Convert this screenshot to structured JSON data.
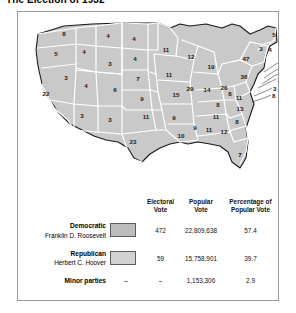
{
  "title": "The Election of 1932",
  "map": {
    "name": "united-states-electoral-map-1932",
    "fill_color": "#c9c9c9",
    "border_color": "#ffffff",
    "outline_color": "#1a1a1a",
    "states": [
      {
        "code": "WA",
        "ev": "8",
        "x": 46,
        "y": 22
      },
      {
        "code": "OR",
        "ev": "5",
        "x": 38,
        "y": 42
      },
      {
        "code": "CA",
        "ev": "22",
        "x": 26,
        "y": 82
      },
      {
        "code": "NV",
        "ev": "3",
        "x": 48,
        "y": 66
      },
      {
        "code": "ID",
        "ev": "4",
        "x": 64,
        "y": 40
      },
      {
        "code": "MT",
        "ev": "4",
        "x": 88,
        "y": 24
      },
      {
        "code": "WY",
        "ev": "3",
        "x": 90,
        "y": 52
      },
      {
        "code": "UT",
        "ev": "4",
        "x": 68,
        "y": 74
      },
      {
        "code": "AZ",
        "ev": "3",
        "x": 62,
        "y": 104
      },
      {
        "code": "CO",
        "ev": "6",
        "x": 97,
        "y": 78
      },
      {
        "code": "NM",
        "ev": "3",
        "x": 90,
        "y": 108
      },
      {
        "code": "ND",
        "ev": "4",
        "x": 114,
        "y": 27
      },
      {
        "code": "SD",
        "ev": "4",
        "x": 116,
        "y": 47
      },
      {
        "code": "NE",
        "ev": "7",
        "x": 120,
        "y": 67
      },
      {
        "code": "KS",
        "ev": "9",
        "x": 124,
        "y": 87
      },
      {
        "code": "OK",
        "ev": "11",
        "x": 128,
        "y": 105
      },
      {
        "code": "TX",
        "ev": "23",
        "x": 115,
        "y": 130
      },
      {
        "code": "MN",
        "ev": "11",
        "x": 146,
        "y": 38
      },
      {
        "code": "IA",
        "ev": "11",
        "x": 150,
        "y": 63
      },
      {
        "code": "MO",
        "ev": "15",
        "x": 157,
        "y": 83
      },
      {
        "code": "AR",
        "ev": "9",
        "x": 155,
        "y": 106
      },
      {
        "code": "LA",
        "ev": "10",
        "x": 162,
        "y": 124
      },
      {
        "code": "WI",
        "ev": "12",
        "x": 172,
        "y": 45
      },
      {
        "code": "IL",
        "ev": "29",
        "x": 172,
        "y": 77
      },
      {
        "code": "MI",
        "ev": "19",
        "x": 193,
        "y": 55
      },
      {
        "code": "IN",
        "ev": "14",
        "x": 189,
        "y": 78
      },
      {
        "code": "OH",
        "ev": "26",
        "x": 205,
        "y": 76
      },
      {
        "code": "KY",
        "ev": "8",
        "x": 200,
        "y": 93
      },
      {
        "code": "TN",
        "ev": "11",
        "x": 198,
        "y": 105
      },
      {
        "code": "MS",
        "ev": "9",
        "x": 176,
        "y": 116
      },
      {
        "code": "AL",
        "ev": "11",
        "x": 190,
        "y": 118
      },
      {
        "code": "GA",
        "ev": "12",
        "x": 206,
        "y": 120
      },
      {
        "code": "FL",
        "ev": "7",
        "x": 222,
        "y": 143
      },
      {
        "code": "SC",
        "ev": "8",
        "x": 219,
        "y": 110
      },
      {
        "code": "NC",
        "ev": "13",
        "x": 222,
        "y": 97
      },
      {
        "code": "VA",
        "ev": "11",
        "x": 221,
        "y": 86
      },
      {
        "code": "WV",
        "ev": "8",
        "x": 212,
        "y": 82
      },
      {
        "code": "PA",
        "ev": "36",
        "x": 226,
        "y": 65
      },
      {
        "code": "NY",
        "ev": "47",
        "x": 228,
        "y": 47
      },
      {
        "code": "VT",
        "ev": "3",
        "x": 243,
        "y": 37
      },
      {
        "code": "NH",
        "ev": "4",
        "x": 252,
        "y": 38
      },
      {
        "code": "ME",
        "ev": "5",
        "x": 256,
        "y": 23
      }
    ],
    "callouts": [
      {
        "code": "MA",
        "ev": "17",
        "x": 272,
        "y": 47
      },
      {
        "code": "RI",
        "ev": "4",
        "x": 272,
        "y": 57
      },
      {
        "code": "CT",
        "ev": "8",
        "x": 268,
        "y": 62
      },
      {
        "code": "NJ",
        "ev": "16",
        "x": 263,
        "y": 68
      },
      {
        "code": "DE",
        "ev": "3",
        "x": 259,
        "y": 76
      },
      {
        "code": "MD",
        "ev": "8",
        "x": 258,
        "y": 83
      }
    ]
  },
  "table": {
    "headers": {
      "electoral_vote": "Electoral\nVote",
      "electoral_vote_l1": "Electoral",
      "electoral_vote_l2": "Vote",
      "popular_vote_l1": "Popular",
      "popular_vote_l2": "Vote",
      "percentage_l1": "Percentage of",
      "percentage_l2": "Popular Vote"
    },
    "rows": [
      {
        "party": "Democratic",
        "candidate": "Franklin D. Roosevelt",
        "swatch": "#bdbdbd",
        "electoral_vote": "472",
        "popular_vote": "22,809,638",
        "percentage": "57.4"
      },
      {
        "party": "Republican",
        "candidate": "Herbert C. Hoover",
        "swatch": "#d2d2d2",
        "electoral_vote": "59",
        "popular_vote": "15,758,901",
        "percentage": "39.7"
      }
    ],
    "minor": {
      "label": "Minor parties",
      "electoral_vote": "–",
      "electoral_dash2": "–",
      "popular_vote": "1,153,306",
      "percentage": "2.9"
    }
  }
}
